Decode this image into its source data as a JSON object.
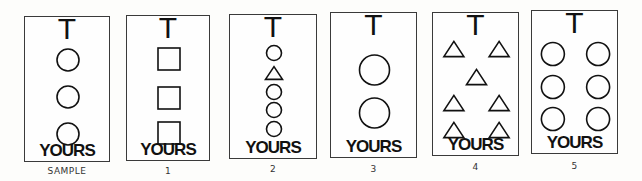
{
  "top_marker": "T",
  "bottom_label": "YOURS",
  "cards": [
    {
      "caption": "SAMPLE",
      "shapes": [
        {
          "type": "circle",
          "col": "center",
          "row": 0
        },
        {
          "type": "circle",
          "col": "center",
          "row": 1
        },
        {
          "type": "circle",
          "col": "center",
          "row": 2
        }
      ]
    },
    {
      "caption": "1",
      "shapes": [
        {
          "type": "square",
          "col": "center",
          "row": 0
        },
        {
          "type": "square",
          "col": "center",
          "row": 1
        },
        {
          "type": "square",
          "col": "center",
          "row": 2
        }
      ]
    },
    {
      "caption": "2",
      "shapes": [
        {
          "type": "circle",
          "col": "center",
          "row": 0
        },
        {
          "type": "triangle",
          "col": "center",
          "row": 1
        },
        {
          "type": "circle",
          "col": "center",
          "row": 2
        },
        {
          "type": "circle",
          "col": "center",
          "row": 3
        },
        {
          "type": "circle",
          "col": "center",
          "row": 4
        }
      ]
    },
    {
      "caption": "3",
      "shapes": [
        {
          "type": "circle",
          "col": "center",
          "row": 0
        },
        {
          "type": "circle",
          "col": "center",
          "row": 1
        }
      ]
    },
    {
      "caption": "4",
      "shapes": [
        {
          "type": "triangle",
          "col": "left",
          "row": 0
        },
        {
          "type": "triangle",
          "col": "right",
          "row": 0
        },
        {
          "type": "triangle",
          "col": "center",
          "row": 1
        },
        {
          "type": "triangle",
          "col": "left",
          "row": 2
        },
        {
          "type": "triangle",
          "col": "right",
          "row": 2
        },
        {
          "type": "triangle",
          "col": "left",
          "row": 3
        },
        {
          "type": "triangle",
          "col": "right",
          "row": 3
        }
      ]
    },
    {
      "caption": "5",
      "shapes": [
        {
          "type": "circle",
          "col": "left",
          "row": 0
        },
        {
          "type": "circle",
          "col": "right",
          "row": 0
        },
        {
          "type": "circle",
          "col": "left",
          "row": 1
        },
        {
          "type": "circle",
          "col": "right",
          "row": 1
        },
        {
          "type": "circle",
          "col": "left",
          "row": 2
        },
        {
          "type": "circle",
          "col": "right",
          "row": 2
        }
      ]
    }
  ]
}
